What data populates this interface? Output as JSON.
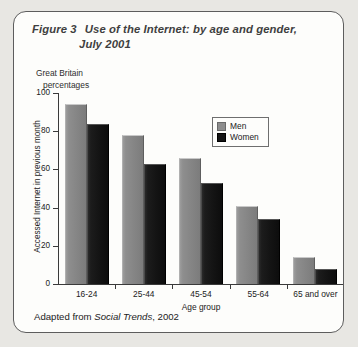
{
  "figure": {
    "label": "Figure 3",
    "title_line_1": "Use of the Internet: by age and gender,",
    "title_line_2": "July 2001",
    "subtitle_line_1": "Great Britain",
    "subtitle_line_2": "percentages",
    "source_prefix": "Adapted from ",
    "source_italic": "Social Trends",
    "source_suffix": ", 2002"
  },
  "legend": {
    "position": "inside-top-right",
    "entries": [
      {
        "label": "Men",
        "color": "#8d8d8d"
      },
      {
        "label": "Women",
        "color": "#141414"
      }
    ]
  },
  "chart_data": {
    "type": "bar",
    "title": "Use of the Internet: by age and gender, July 2001",
    "subtitle": "Great Britain percentages",
    "categories": [
      "16-24",
      "25-44",
      "45-54",
      "55-64",
      "65 and over"
    ],
    "series": [
      {
        "name": "Men",
        "color": "#8d8d8d",
        "values": [
          94,
          78,
          66,
          41,
          14
        ]
      },
      {
        "name": "Women",
        "color": "#141414",
        "values": [
          84,
          63,
          53,
          34,
          8
        ]
      }
    ],
    "xlabel": "Age group",
    "ylabel": "Accessed Internet in previous month",
    "ylim": [
      0,
      100
    ],
    "yticks": [
      0,
      20,
      40,
      60,
      80,
      100
    ],
    "ytick_labels": [
      "0",
      "20",
      "40",
      "60",
      "80",
      "100"
    ],
    "grid": false,
    "legend_position": "inside-top-right",
    "units": "percentages"
  }
}
